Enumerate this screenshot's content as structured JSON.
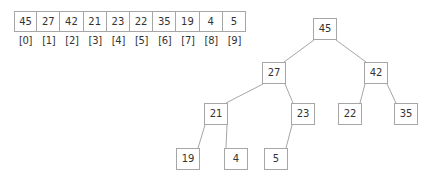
{
  "diagram": {
    "stroke_color": "#a6a6a6",
    "text_color": "#333333",
    "background_color": "#ffffff"
  },
  "array": {
    "values": [
      "45",
      "27",
      "42",
      "21",
      "23",
      "22",
      "35",
      "19",
      "4",
      "5"
    ],
    "indices": [
      "[0]",
      "[1]",
      "[2]",
      "[3]",
      "[4]",
      "[5]",
      "[6]",
      "[7]",
      "[8]",
      "[9]"
    ],
    "geometry": {
      "x": 14,
      "y": 11,
      "cell_width": 23.2,
      "cell_height": 21,
      "index_row_y": 34,
      "index_row_height": 14
    }
  },
  "tree": {
    "nodes": [
      {
        "id": "n0",
        "label": "45",
        "x": 313,
        "y": 18,
        "w": 24,
        "h": 22
      },
      {
        "id": "n1",
        "label": "27",
        "x": 262,
        "y": 62,
        "w": 24,
        "h": 22
      },
      {
        "id": "n2",
        "label": "42",
        "x": 364,
        "y": 62,
        "w": 24,
        "h": 22
      },
      {
        "id": "n3",
        "label": "21",
        "x": 204,
        "y": 103,
        "w": 24,
        "h": 22
      },
      {
        "id": "n4",
        "label": "23",
        "x": 291,
        "y": 103,
        "w": 24,
        "h": 22
      },
      {
        "id": "n5",
        "label": "22",
        "x": 338,
        "y": 103,
        "w": 24,
        "h": 22
      },
      {
        "id": "n6",
        "label": "35",
        "x": 394,
        "y": 103,
        "w": 24,
        "h": 22
      },
      {
        "id": "n7",
        "label": "19",
        "x": 176,
        "y": 148,
        "w": 24,
        "h": 22
      },
      {
        "id": "n8",
        "label": "4",
        "x": 224,
        "y": 148,
        "w": 24,
        "h": 22
      },
      {
        "id": "n9",
        "label": "5",
        "x": 264,
        "y": 148,
        "w": 24,
        "h": 22
      }
    ],
    "edges": [
      {
        "from": "n0",
        "to": "n1",
        "x1": 314,
        "y1": 40,
        "x2": 284,
        "y2": 62
      },
      {
        "from": "n0",
        "to": "n2",
        "x1": 336,
        "y1": 40,
        "x2": 366,
        "y2": 62
      },
      {
        "from": "n1",
        "to": "n3",
        "x1": 263,
        "y1": 84,
        "x2": 226,
        "y2": 103
      },
      {
        "from": "n1",
        "to": "n4",
        "x1": 285,
        "y1": 84,
        "x2": 293,
        "y2": 103
      },
      {
        "from": "n2",
        "to": "n5",
        "x1": 365,
        "y1": 84,
        "x2": 360,
        "y2": 103
      },
      {
        "from": "n2",
        "to": "n6",
        "x1": 387,
        "y1": 84,
        "x2": 396,
        "y2": 103
      },
      {
        "from": "n3",
        "to": "n7",
        "x1": 205,
        "y1": 125,
        "x2": 198,
        "y2": 148
      },
      {
        "from": "n3",
        "to": "n8",
        "x1": 227,
        "y1": 125,
        "x2": 226,
        "y2": 148
      },
      {
        "from": "n4",
        "to": "n9",
        "x1": 292,
        "y1": 125,
        "x2": 286,
        "y2": 148
      }
    ]
  }
}
